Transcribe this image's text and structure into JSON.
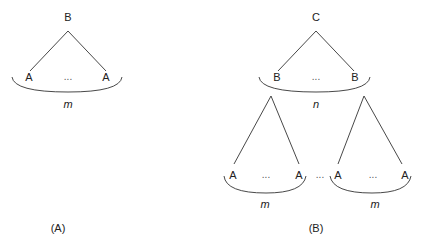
{
  "diagram_a": {
    "caption": "(A)",
    "root": "B",
    "leaf_left": "A",
    "leaf_right": "A",
    "ellipsis": "...",
    "count_label": "m"
  },
  "diagram_b": {
    "caption": "(B)",
    "root": "C",
    "child_left": "B",
    "child_right": "B",
    "child_ellipsis": "...",
    "child_count_label": "n",
    "subtree_left": {
      "leaf_left": "A",
      "leaf_right": "A",
      "ellipsis": "...",
      "count_label": "m"
    },
    "between_ellipsis": "...",
    "subtree_right": {
      "leaf_left": "A",
      "leaf_right": "A",
      "ellipsis": "...",
      "count_label": "m"
    }
  }
}
